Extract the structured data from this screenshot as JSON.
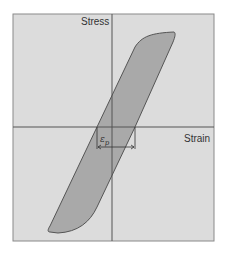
{
  "diagram": {
    "type": "stress-strain hysteresis loop",
    "axes": {
      "y_label": "Stress",
      "x_label": "Strain"
    },
    "annotation": {
      "symbol": "ε",
      "subscript": "p",
      "meaning": "plastic strain width of the loop at zero stress"
    },
    "colors": {
      "background": "#dcdcdc",
      "loop_fill": "#a9a9a9",
      "lines": "#555555",
      "frame": "#8a8a8a"
    }
  }
}
